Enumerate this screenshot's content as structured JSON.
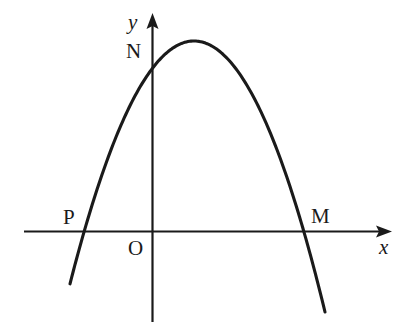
{
  "figure": {
    "kind": "coordinate-plane-parabola-sketch",
    "background_color": "#ffffff",
    "stroke_color": "#1a1a1a"
  },
  "axes": {
    "x_axis": {
      "label": "x",
      "label_style": "italic",
      "arrow": "right",
      "y_pixel": 231,
      "x_start_pixel": 24,
      "x_end_pixel": 392
    },
    "y_axis": {
      "label": "y",
      "label_style": "italic",
      "arrow": "up",
      "x_pixel": 152,
      "y_start_pixel": 13,
      "y_end_pixel": 322
    },
    "origin": {
      "label": "O"
    }
  },
  "points": [
    {
      "name": "N",
      "label": "N",
      "description": "y-intercept of the parabola",
      "x_pixel": 152,
      "y_pixel": 57
    },
    {
      "name": "P",
      "label": "P",
      "description": "left x-intercept of the parabola",
      "x_pixel": 82,
      "y_pixel": 231
    },
    {
      "name": "M",
      "label": "M",
      "description": "right x-intercept of the parabola",
      "x_pixel": 305,
      "y_pixel": 231
    }
  ],
  "chart_data": {
    "type": "line",
    "title": "",
    "xlabel": "x",
    "ylabel": "y",
    "grid": false,
    "legend": null,
    "curve": {
      "name": "parabola",
      "shape": "downward-opening parabola",
      "orientation": "opens-down",
      "vertex_pixel": {
        "x": 194,
        "y": 41
      },
      "roots_pixel": [
        82,
        305
      ],
      "y_intercept_pixel": {
        "x": 152,
        "y": 57
      },
      "path_pixels": [
        {
          "x": 70,
          "y": 313
        },
        {
          "x": 82,
          "y": 231
        },
        {
          "x": 100,
          "y": 160
        },
        {
          "x": 120,
          "y": 107
        },
        {
          "x": 140,
          "y": 71
        },
        {
          "x": 152,
          "y": 57
        },
        {
          "x": 170,
          "y": 45
        },
        {
          "x": 194,
          "y": 41
        },
        {
          "x": 220,
          "y": 49
        },
        {
          "x": 245,
          "y": 72
        },
        {
          "x": 270,
          "y": 113
        },
        {
          "x": 290,
          "y": 160
        },
        {
          "x": 305,
          "y": 231
        },
        {
          "x": 325,
          "y": 312
        }
      ]
    },
    "annotations": [
      {
        "text": "N",
        "at_pixel": {
          "x": 136,
          "y": 52
        }
      },
      {
        "text": "P",
        "at_pixel": {
          "x": 71,
          "y": 218
        }
      },
      {
        "text": "M",
        "at_pixel": {
          "x": 320,
          "y": 217
        }
      },
      {
        "text": "O",
        "at_pixel": {
          "x": 136,
          "y": 249
        }
      },
      {
        "text": "y",
        "at_pixel": {
          "x": 135,
          "y": 23
        }
      },
      {
        "text": "x",
        "at_pixel": {
          "x": 386,
          "y": 248
        }
      }
    ]
  }
}
